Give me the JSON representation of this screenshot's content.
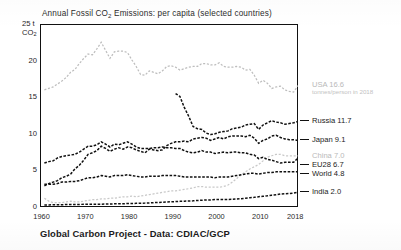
{
  "chart_data": {
    "type": "line",
    "title": "Annual Fossil CO2 Emissions: per capita (selected countries)",
    "title_prefix": "Annual Fossil CO",
    "title_sub": "2",
    "title_suffix": " Emissions: per capita (selected countries)",
    "xlabel": "",
    "ylabel": "25 t CO2",
    "yaxis_unit_value": "25 t",
    "yaxis_unit_sub": "2",
    "yaxis_unit_co": "CO",
    "xlim": [
      1959,
      2018
    ],
    "ylim": [
      0,
      25
    ],
    "grid": false,
    "legend_position": "right",
    "yticks": [
      0,
      5,
      10,
      15,
      20
    ],
    "ytick_labels": [
      "0",
      "5",
      "10",
      "15",
      "20"
    ],
    "xticks": [
      1960,
      1970,
      1980,
      1990,
      2000,
      2010,
      2018
    ],
    "xtick_labels": [
      "1960",
      "1970",
      "1980",
      "1990",
      "2000",
      "2010",
      "2018"
    ],
    "x": [
      1960,
      1961,
      1962,
      1963,
      1964,
      1965,
      1966,
      1967,
      1968,
      1969,
      1970,
      1971,
      1972,
      1973,
      1974,
      1975,
      1976,
      1977,
      1978,
      1979,
      1980,
      1981,
      1982,
      1983,
      1984,
      1985,
      1986,
      1987,
      1988,
      1989,
      1990,
      1991,
      1992,
      1993,
      1994,
      1995,
      1996,
      1997,
      1998,
      1999,
      2000,
      2001,
      2002,
      2003,
      2004,
      2005,
      2006,
      2007,
      2008,
      2009,
      2010,
      2011,
      2012,
      2013,
      2014,
      2015,
      2016,
      2017,
      2018
    ],
    "series": [
      {
        "name": "USA",
        "label": "USA 16.6",
        "value_2018": 16.6,
        "color": "#bdbdbd",
        "style": "dotted-grey",
        "values": [
          16.0,
          16.2,
          16.4,
          16.8,
          17.2,
          17.7,
          18.4,
          18.8,
          19.6,
          20.3,
          20.9,
          20.8,
          21.6,
          22.5,
          21.4,
          20.3,
          21.2,
          21.3,
          21.3,
          21.1,
          20.1,
          19.2,
          18.1,
          18.0,
          18.6,
          18.4,
          18.2,
          18.6,
          19.2,
          19.3,
          19.1,
          18.7,
          18.9,
          19.1,
          19.2,
          19.2,
          19.6,
          19.6,
          19.4,
          19.4,
          19.7,
          19.2,
          19.1,
          19.1,
          19.2,
          19.1,
          18.7,
          18.8,
          18.0,
          16.9,
          17.3,
          16.9,
          16.2,
          16.4,
          16.5,
          16.0,
          15.8,
          15.7,
          16.6
        ]
      },
      {
        "name": "Russia",
        "label": "Russia 11.7",
        "value_2018": 11.7,
        "color": "#111111",
        "style": "dashed-black",
        "values": [
          null,
          null,
          null,
          null,
          null,
          null,
          null,
          null,
          null,
          null,
          null,
          null,
          null,
          null,
          null,
          null,
          null,
          null,
          null,
          null,
          null,
          null,
          null,
          null,
          null,
          null,
          null,
          null,
          null,
          null,
          15.5,
          15.1,
          13.6,
          12.4,
          11.0,
          10.7,
          10.6,
          10.1,
          9.9,
          10.0,
          10.2,
          10.3,
          10.4,
          10.7,
          10.8,
          10.9,
          11.2,
          11.3,
          11.4,
          10.6,
          11.2,
          11.5,
          11.8,
          11.6,
          11.5,
          11.3,
          11.4,
          11.5,
          11.7
        ]
      },
      {
        "name": "Japan",
        "label": "Japan 9.1",
        "value_2018": 9.1,
        "color": "#111111",
        "style": "dashed-black",
        "values": [
          2.9,
          3.2,
          3.4,
          3.6,
          4.0,
          4.2,
          4.5,
          5.2,
          5.7,
          6.4,
          7.2,
          7.4,
          7.7,
          8.3,
          8.0,
          7.6,
          7.9,
          8.1,
          7.9,
          8.2,
          8.1,
          7.8,
          7.6,
          7.4,
          7.9,
          7.8,
          7.7,
          7.8,
          8.4,
          8.7,
          8.9,
          8.9,
          9.0,
          8.9,
          9.3,
          9.4,
          9.5,
          9.4,
          9.1,
          9.3,
          9.5,
          9.3,
          9.6,
          9.7,
          9.7,
          9.7,
          9.6,
          9.8,
          9.4,
          8.7,
          9.1,
          9.3,
          9.7,
          9.8,
          9.5,
          9.3,
          9.2,
          9.2,
          9.1
        ]
      },
      {
        "name": "China",
        "label": "China 7.0",
        "value_2018": 7.0,
        "color": "#c9c9c9",
        "style": "dotted-grey",
        "values": [
          1.2,
          0.8,
          0.6,
          0.6,
          0.6,
          0.7,
          0.8,
          0.7,
          0.7,
          0.8,
          0.9,
          1.0,
          1.0,
          1.1,
          1.1,
          1.2,
          1.2,
          1.3,
          1.4,
          1.4,
          1.5,
          1.4,
          1.5,
          1.6,
          1.7,
          1.8,
          1.9,
          2.0,
          2.1,
          2.2,
          2.2,
          2.3,
          2.4,
          2.5,
          2.6,
          2.8,
          2.8,
          2.7,
          2.7,
          2.7,
          2.7,
          2.8,
          3.0,
          3.4,
          3.9,
          4.4,
          4.8,
          5.2,
          5.5,
          5.8,
          6.3,
          6.8,
          7.0,
          7.2,
          7.2,
          7.0,
          7.0,
          7.0,
          7.0
        ]
      },
      {
        "name": "EU28",
        "label": "EU28 6.7",
        "value_2018": 6.7,
        "color": "#111111",
        "style": "dashed-black",
        "values": [
          6.0,
          6.2,
          6.3,
          6.7,
          6.9,
          7.0,
          7.1,
          7.2,
          7.5,
          7.9,
          8.3,
          8.3,
          8.5,
          8.9,
          8.6,
          8.2,
          8.6,
          8.5,
          8.7,
          8.9,
          8.6,
          8.2,
          8.0,
          8.0,
          8.0,
          8.1,
          8.1,
          8.2,
          8.1,
          8.1,
          8.0,
          8.0,
          7.7,
          7.5,
          7.4,
          7.5,
          7.7,
          7.5,
          7.5,
          7.3,
          7.4,
          7.5,
          7.4,
          7.5,
          7.5,
          7.4,
          7.4,
          7.2,
          7.1,
          6.6,
          6.8,
          6.5,
          6.4,
          6.2,
          6.0,
          6.1,
          6.1,
          6.1,
          6.7
        ]
      },
      {
        "name": "World",
        "label": "World 4.8",
        "value_2018": 4.8,
        "color": "#111111",
        "style": "dashed-black",
        "values": [
          3.1,
          3.1,
          3.1,
          3.2,
          3.4,
          3.4,
          3.5,
          3.5,
          3.6,
          3.8,
          4.0,
          4.0,
          4.1,
          4.3,
          4.2,
          4.1,
          4.3,
          4.3,
          4.3,
          4.4,
          4.3,
          4.2,
          4.1,
          4.1,
          4.2,
          4.2,
          4.2,
          4.3,
          4.3,
          4.3,
          4.3,
          4.2,
          4.1,
          4.1,
          4.1,
          4.1,
          4.1,
          4.1,
          4.1,
          4.0,
          4.1,
          4.1,
          4.1,
          4.2,
          4.3,
          4.4,
          4.5,
          4.6,
          4.6,
          4.5,
          4.6,
          4.7,
          4.7,
          4.8,
          4.8,
          4.8,
          4.8,
          4.8,
          4.8
        ]
      },
      {
        "name": "India",
        "label": "India 2.0",
        "value_2018": 2.0,
        "color": "#111111",
        "style": "dashed-black",
        "values": [
          0.27,
          0.28,
          0.3,
          0.31,
          0.32,
          0.33,
          0.34,
          0.34,
          0.35,
          0.37,
          0.37,
          0.38,
          0.39,
          0.39,
          0.4,
          0.42,
          0.43,
          0.45,
          0.45,
          0.47,
          0.47,
          0.5,
          0.52,
          0.53,
          0.56,
          0.59,
          0.62,
          0.65,
          0.68,
          0.72,
          0.74,
          0.77,
          0.8,
          0.81,
          0.84,
          0.89,
          0.92,
          0.96,
          0.97,
          1.02,
          1.03,
          1.02,
          1.04,
          1.05,
          1.09,
          1.14,
          1.2,
          1.26,
          1.32,
          1.4,
          1.47,
          1.53,
          1.62,
          1.66,
          1.77,
          1.8,
          1.84,
          1.9,
          2.0
        ]
      }
    ],
    "legend_note": "tonnes/person in 2018",
    "source": "Global Carbon Project - Data: CDIAC/GCP"
  },
  "legend": {
    "entries": [
      {
        "label": "USA 16.6",
        "muted": true,
        "note": "tonnes/person in 2018"
      },
      {
        "label": "Russia 11.7",
        "muted": false
      },
      {
        "label": "Japan 9.1",
        "muted": false
      },
      {
        "label": "China 7.0",
        "muted": true
      },
      {
        "label": "EU28 6.7",
        "muted": false
      },
      {
        "label": "World 4.8",
        "muted": false
      },
      {
        "label": "India 2.0",
        "muted": false
      }
    ]
  },
  "footer": {
    "text": "Global Carbon Project - Data: CDIAC/GCP"
  }
}
